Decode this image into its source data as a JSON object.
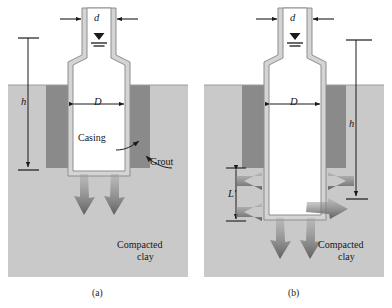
{
  "figure": {
    "type": "engineering-cross-section",
    "title_visible": false,
    "panels": [
      {
        "id": "a",
        "caption": "(a)",
        "dimension_labels": [
          {
            "name": "riser-diameter",
            "text": "d"
          },
          {
            "name": "borehole-diameter",
            "text": "D"
          },
          {
            "name": "head-height",
            "text": "h"
          }
        ],
        "annotations": [
          {
            "name": "casing-label",
            "text": "Casing"
          },
          {
            "name": "grout-label",
            "text": "Grout"
          }
        ],
        "soil_label_line1": "Compacted",
        "soil_label_line2": "clay",
        "seepage_arrows": 2,
        "seepage_direction": "downward"
      },
      {
        "id": "b",
        "caption": "(b)",
        "dimension_labels": [
          {
            "name": "riser-diameter",
            "text": "d"
          },
          {
            "name": "borehole-diameter",
            "text": "D"
          },
          {
            "name": "head-height",
            "text": "h"
          },
          {
            "name": "uncased-length",
            "text": "L′"
          }
        ],
        "annotations": [],
        "soil_label_line1": "Compacted",
        "soil_label_line2": "clay",
        "seepage_arrows": 6,
        "seepage_direction": "downward-and-lateral"
      }
    ],
    "water_table_symbol": {
      "name": "water-table-icon",
      "description": "inverted triangle with two horizontal lines"
    },
    "colors": {
      "soil_light": "#c9c9c9",
      "grout_dark": "#8a8a8a",
      "casing_fill": "#ffffff",
      "casing_wall": "#d4d4d4",
      "casing_outline": "#8e8e8e",
      "arrow_gray": "#6f6f6f",
      "line_black": "#1a1a1a",
      "background": "#ffffff"
    }
  }
}
